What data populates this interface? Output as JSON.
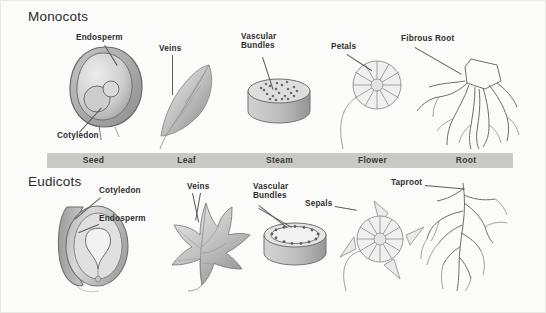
{
  "figure": {
    "title_monocots": "Monocots",
    "title_eudicots": "Eudicots"
  },
  "columns": [
    {
      "key": "seed",
      "label": "Seed"
    },
    {
      "key": "leaf",
      "label": "Leaf"
    },
    {
      "key": "stem",
      "label": "Steam"
    },
    {
      "key": "flower",
      "label": "Flower"
    },
    {
      "key": "root",
      "label": "Root"
    }
  ],
  "monocots": {
    "seed": {
      "labels": [
        "Endosperm",
        "Cotyledon"
      ]
    },
    "leaf": {
      "labels": [
        "Veins"
      ]
    },
    "stem": {
      "labels": [
        "Vascular\nBundles"
      ]
    },
    "flower": {
      "labels": [
        "Petals"
      ]
    },
    "root": {
      "labels": [
        "Fibrous Root"
      ]
    }
  },
  "eudicots": {
    "seed": {
      "labels": [
        "Cotyledon",
        "Endosperm"
      ]
    },
    "leaf": {
      "labels": [
        "Veins"
      ]
    },
    "stem": {
      "labels": [
        "Vascular\nBundles"
      ]
    },
    "flower": {
      "labels": [
        "Sepals"
      ]
    },
    "root": {
      "labels": [
        "Taproot"
      ]
    }
  },
  "colors": {
    "background": "#fbfbfa",
    "band": "#c9c9c7",
    "band_text": "#3a3a3a",
    "label_text": "#2e2e2e",
    "line": "#6e6e6e",
    "fill_light": "#dcdcdc",
    "fill_mid": "#bdbdbd",
    "fill_dark": "#9a9a9a"
  }
}
